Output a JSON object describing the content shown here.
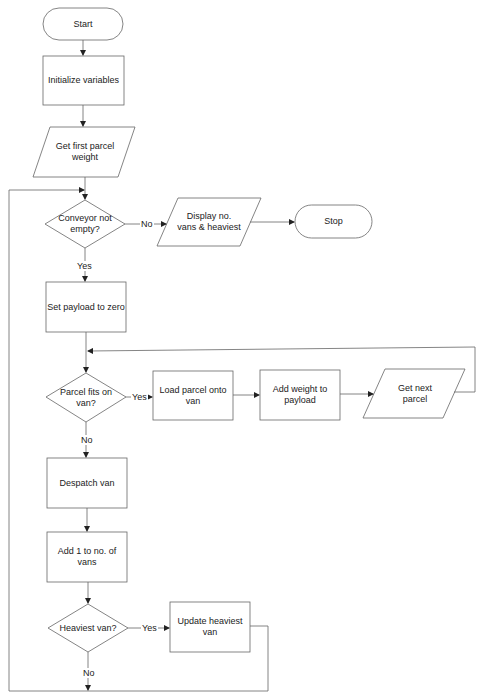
{
  "diagram": {
    "type": "flowchart",
    "nodes": {
      "start": {
        "label": "Start",
        "shape": "terminal"
      },
      "init": {
        "label": "Initialize variables",
        "shape": "process"
      },
      "get_first": {
        "label": "Get first parcel weight",
        "shape": "io"
      },
      "conveyor": {
        "label": "Conveyor not empty?",
        "shape": "decision"
      },
      "display": {
        "label": "Display no. vans & heaviest",
        "shape": "io"
      },
      "stop": {
        "label": "Stop",
        "shape": "terminal"
      },
      "set_payload": {
        "label": "Set payload to zero",
        "shape": "process"
      },
      "fits": {
        "label": "Parcel fits on van?",
        "shape": "decision"
      },
      "load": {
        "label": "Load parcel onto van",
        "shape": "process"
      },
      "add_weight": {
        "label": "Add weight to payload",
        "shape": "process"
      },
      "get_next": {
        "label": "Get next parcel",
        "shape": "io"
      },
      "despatch": {
        "label": "Despatch van",
        "shape": "process"
      },
      "add_one": {
        "label": "Add 1 to no. of vans",
        "shape": "process"
      },
      "heaviest": {
        "label": "Heaviest van?",
        "shape": "decision"
      },
      "update": {
        "label": "Update heaviest van",
        "shape": "process"
      }
    },
    "edge_labels": {
      "conveyor_no": "No",
      "conveyor_yes": "Yes",
      "fits_yes": "Yes",
      "fits_no": "No",
      "heaviest_yes": "Yes",
      "heaviest_no": "No"
    },
    "stroke_color": "#555555"
  }
}
